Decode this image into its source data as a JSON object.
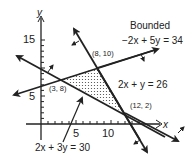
{
  "title": "Bounded",
  "axes": {
    "x_label": "x",
    "y_label": "y",
    "x_ticks": [
      {
        "value": 5,
        "label": "5"
      },
      {
        "value": 10,
        "label": "10"
      }
    ],
    "y_ticks": [
      {
        "value": 5,
        "label": "5"
      },
      {
        "value": 15,
        "label": "15"
      }
    ]
  },
  "lines": [
    {
      "id": "line1",
      "equation": "−2x + 5y = 34"
    },
    {
      "id": "line2",
      "equation": "2x + y = 26"
    },
    {
      "id": "line3",
      "equation": "2x + 3y = 30"
    }
  ],
  "vertices": [
    {
      "label": "(3, 8)",
      "x": 3,
      "y": 8
    },
    {
      "label": "(8, 10)",
      "x": 8,
      "y": 10
    },
    {
      "label": "(12, 2)",
      "x": 12,
      "y": 2
    }
  ],
  "region": {
    "type": "bounded",
    "fill": "dotted"
  },
  "colors": {
    "ink": "#222222",
    "background": "#ffffff"
  }
}
